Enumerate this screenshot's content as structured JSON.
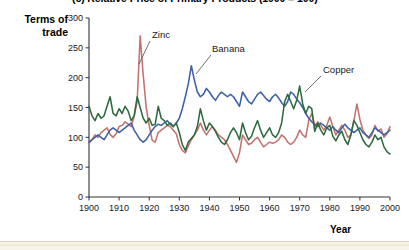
{
  "figure": {
    "title": "(c) Relative Price of Primary Products (1900 = 100)",
    "y_axis_title_line1": "Terms of",
    "y_axis_title_line2": "trade",
    "x_axis_title": "Year"
  },
  "colors": {
    "zinc": "#c4726e",
    "banana": "#3c62a8",
    "copper": "#2d6b3f",
    "axis": "#333333",
    "text": "#1a1a1a",
    "background": "#ffffff",
    "page_band": "#f7f3e8"
  },
  "labels": {
    "zinc": "Zinc",
    "banana": "Banana",
    "copper": "Copper"
  },
  "axes": {
    "y_ticks": [
      "0",
      "50",
      "100",
      "150",
      "200",
      "250",
      "300"
    ],
    "x_ticks": [
      "1900",
      "1910",
      "1920",
      "1930",
      "1940",
      "1950",
      "1960",
      "1970",
      "1980",
      "1990",
      "2000"
    ]
  },
  "chart_data": {
    "type": "line",
    "title": "(c) Relative Price of Primary Products (1900 = 100)",
    "xlabel": "Year",
    "ylabel": "Terms of trade",
    "xlim": [
      1900,
      2000
    ],
    "ylim": [
      0,
      300
    ],
    "yticks": [
      0,
      50,
      100,
      150,
      200,
      250,
      300
    ],
    "xticks": [
      1900,
      1910,
      1920,
      1930,
      1940,
      1950,
      1960,
      1970,
      1980,
      1990,
      2000
    ],
    "grid": false,
    "legend": "inline annotations",
    "annotations": [
      {
        "text": "Zinc",
        "series": "Zinc",
        "x": 1921,
        "y": 258
      },
      {
        "text": "Banana",
        "series": "Banana",
        "x": 1936,
        "y": 235
      },
      {
        "text": "Copper",
        "series": "Copper",
        "x": 1976,
        "y": 196
      }
    ],
    "x": [
      1900,
      1901,
      1902,
      1903,
      1904,
      1905,
      1906,
      1907,
      1908,
      1909,
      1910,
      1911,
      1912,
      1913,
      1914,
      1915,
      1916,
      1917,
      1918,
      1919,
      1920,
      1921,
      1922,
      1923,
      1924,
      1925,
      1926,
      1927,
      1928,
      1929,
      1930,
      1931,
      1932,
      1933,
      1934,
      1935,
      1936,
      1937,
      1938,
      1939,
      1940,
      1941,
      1942,
      1943,
      1944,
      1945,
      1946,
      1947,
      1948,
      1949,
      1950,
      1951,
      1952,
      1953,
      1954,
      1955,
      1956,
      1957,
      1958,
      1959,
      1960,
      1961,
      1962,
      1963,
      1964,
      1965,
      1966,
      1967,
      1968,
      1969,
      1970,
      1971,
      1972,
      1973,
      1974,
      1975,
      1976,
      1977,
      1978,
      1979,
      1980,
      1981,
      1982,
      1983,
      1984,
      1985,
      1986,
      1987,
      1988,
      1989,
      1990,
      1991,
      1992,
      1993,
      1994,
      1995,
      1996,
      1997,
      1998,
      1999,
      2000
    ],
    "series": [
      {
        "name": "Zinc",
        "color": "#c4726e",
        "values": [
          90,
          96,
          104,
          100,
          108,
          112,
          116,
          105,
          100,
          106,
          118,
          120,
          126,
          122,
          118,
          135,
          160,
          270,
          205,
          150,
          120,
          95,
          92,
          108,
          112,
          116,
          120,
          118,
          112,
          106,
          88,
          78,
          74,
          86,
          96,
          104,
          112,
          124,
          112,
          104,
          112,
          118,
          112,
          104,
          100,
          96,
          88,
          78,
          68,
          58,
          74,
          104,
          96,
          88,
          90,
          96,
          100,
          92,
          84,
          88,
          92,
          90,
          92,
          96,
          104,
          100,
          92,
          88,
          92,
          100,
          112,
          104,
          100,
          128,
          140,
          118,
          126,
          120,
          112,
          120,
          134,
          118,
          104,
          112,
          120,
          112,
          100,
          104,
          128,
          156,
          130,
          112,
          104,
          98,
          104,
          120,
          110,
          114,
          100,
          106,
          118
        ]
      },
      {
        "name": "Banana",
        "color": "#3c62a8",
        "values": [
          92,
          96,
          100,
          104,
          100,
          96,
          104,
          112,
          116,
          112,
          108,
          112,
          116,
          120,
          124,
          112,
          104,
          96,
          92,
          96,
          104,
          112,
          118,
          122,
          120,
          124,
          128,
          122,
          118,
          124,
          132,
          148,
          168,
          190,
          220,
          196,
          176,
          168,
          172,
          182,
          176,
          168,
          162,
          170,
          176,
          172,
          168,
          172,
          168,
          160,
          152,
          176,
          168,
          160,
          156,
          164,
          172,
          176,
          170,
          164,
          160,
          168,
          172,
          166,
          158,
          152,
          160,
          176,
          172,
          164,
          158,
          150,
          140,
          132,
          126,
          122,
          118,
          124,
          120,
          116,
          112,
          118,
          112,
          108,
          116,
          122,
          116,
          112,
          108,
          112,
          116,
          108,
          104,
          100,
          108,
          116,
          112,
          108,
          104,
          108,
          112
        ]
      },
      {
        "name": "Copper",
        "color": "#2d6b3f",
        "values": [
          152,
          136,
          128,
          140,
          132,
          136,
          152,
          168,
          140,
          136,
          148,
          140,
          152,
          144,
          128,
          136,
          168,
          150,
          132,
          124,
          132,
          120,
          122,
          152,
          132,
          128,
          120,
          124,
          118,
          124,
          108,
          88,
          78,
          92,
          98,
          104,
          118,
          148,
          128,
          112,
          124,
          118,
          110,
          100,
          92,
          88,
          96,
          108,
          116,
          108,
          96,
          124,
          108,
          96,
          102,
          116,
          128,
          112,
          100,
          108,
          116,
          104,
          100,
          108,
          124,
          160,
          172,
          160,
          148,
          162,
          186,
          156,
          140,
          152,
          148,
          110,
          124,
          112,
          104,
          116,
          120,
          102,
          94,
          104,
          110,
          96,
          88,
          104,
          128,
          120,
          108,
          96,
          88,
          84,
          92,
          104,
          96,
          100,
          84,
          76,
          72
        ]
      }
    ]
  }
}
